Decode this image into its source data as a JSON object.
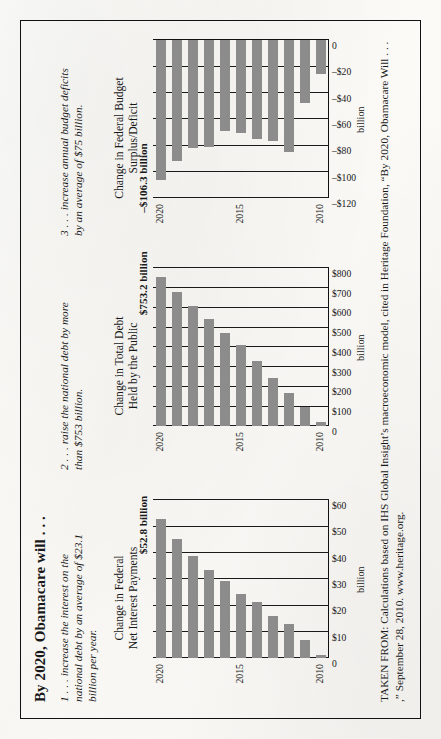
{
  "figure": {
    "title": "By 2020, Obamacare will . . .",
    "bullets": [
      "1 . . . increase the interest on the national debt by an average of $23.1 billion per year.",
      "2 . . . raise the national debt by more than $753 billion.",
      "3 . . . increase annual budget deficits by an average of $75 billion."
    ],
    "source": "TAKEN FROM: Calculations based on IHS Global Insight’s macroeconomic model, cited in Heritage Foundation, “By 2020, Obamacare Will . . . ,” September 28, 2010. www.heritage.org."
  },
  "chart_data": [
    {
      "type": "bar",
      "orientation": "vertical",
      "title": "Change in Federal\nNet Interest Payments",
      "title_line1": "Change in Federal",
      "title_line2": "Net Interest Payments",
      "ylabel": "billion",
      "xlabel": "",
      "ylim": [
        0,
        60
      ],
      "yticks": [
        0,
        10,
        20,
        30,
        40,
        50,
        60
      ],
      "ytick_labels": [
        "0",
        "$10",
        "$20",
        "$30",
        "$40",
        "$50",
        "$60"
      ],
      "categories": [
        2010,
        2011,
        2012,
        2013,
        2014,
        2015,
        2016,
        2017,
        2018,
        2019,
        2020
      ],
      "xtick_labels": [
        "2010",
        "2015",
        "2020"
      ],
      "values": [
        1.0,
        6.8,
        13.0,
        16.0,
        21.2,
        24.4,
        29.2,
        33.6,
        38.6,
        45.0,
        52.8
      ],
      "annotation": "$52.8 billion",
      "grid": true,
      "legend": "none"
    },
    {
      "type": "bar",
      "orientation": "vertical",
      "title": "Change in Total Debt\nHeld by the Public",
      "title_line1": "Change in Total Debt",
      "title_line2": "Held by the Public",
      "ylabel": "billion",
      "xlabel": "",
      "ylim": [
        0,
        800
      ],
      "yticks": [
        0,
        100,
        200,
        300,
        400,
        500,
        600,
        700,
        800
      ],
      "ytick_labels": [
        "0",
        "$100",
        "$200",
        "$300",
        "$400",
        "$500",
        "$600",
        "$700",
        "$800"
      ],
      "categories": [
        2010,
        2011,
        2012,
        2013,
        2014,
        2015,
        2016,
        2017,
        2018,
        2019,
        2020
      ],
      "xtick_labels": [
        "2010",
        "2015",
        "2020"
      ],
      "values": [
        22,
        95,
        165,
        245,
        330,
        410,
        470,
        540,
        610,
        680,
        753.2
      ],
      "annotation": "$753.2 billion",
      "grid": true,
      "legend": "none"
    },
    {
      "type": "bar",
      "orientation": "vertical",
      "title": "Change in Federal Budget\nSurplus/Deficit",
      "title_line1": "Change in Federal Budget",
      "title_line2": "Surplus/Deficit",
      "ylabel": "billion",
      "xlabel": "",
      "ylim": [
        -120,
        0
      ],
      "yticks": [
        0,
        -20,
        -40,
        -60,
        -80,
        -100,
        -120
      ],
      "ytick_labels": [
        "0",
        "–$20",
        "–$40",
        "–$60",
        "–$80",
        "–$100",
        "–$120"
      ],
      "categories": [
        2010,
        2011,
        2012,
        2013,
        2014,
        2015,
        2016,
        2017,
        2018,
        2019,
        2020
      ],
      "xtick_labels": [
        "2010",
        "2015",
        "2020"
      ],
      "values": [
        -26,
        -48,
        -85,
        -77,
        -75,
        -71,
        -69,
        -81,
        -82,
        -92,
        -106.3
      ],
      "annotation": "–$106.3 billion",
      "grid": true,
      "legend": "none"
    }
  ],
  "style": {
    "bar_color": "#8c8c8c",
    "ink_color": "#181818",
    "paper_color": "#faf9f6"
  }
}
